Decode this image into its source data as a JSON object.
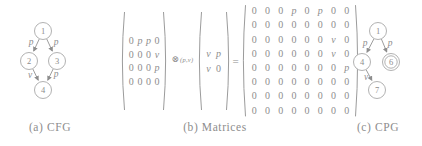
{
  "captions": {
    "a": "(a) CFG",
    "b": "(b) Matrices",
    "c": "(c) CPG"
  },
  "cfg": {
    "nodes": [
      {
        "id": "1"
      },
      {
        "id": "2"
      },
      {
        "id": "3"
      },
      {
        "id": "4"
      }
    ],
    "edges": [
      {
        "from": "1",
        "to": "2",
        "label": "p"
      },
      {
        "from": "1",
        "to": "3",
        "label": "p"
      },
      {
        "from": "2",
        "to": "4",
        "label": "v"
      },
      {
        "from": "3",
        "to": "4",
        "label": "p"
      }
    ]
  },
  "cpg": {
    "nodes": [
      {
        "id": "1"
      },
      {
        "id": "4"
      },
      {
        "id": "6",
        "double_circle": true
      },
      {
        "id": "7"
      }
    ],
    "edges": [
      {
        "from": "1",
        "to": "4",
        "label": "p"
      },
      {
        "from": "1",
        "to": "6",
        "label": "p"
      },
      {
        "from": "4",
        "to": "7",
        "label": "v"
      }
    ]
  },
  "matrices": {
    "a": {
      "rows": [
        [
          "0",
          "p",
          "p",
          "0"
        ],
        [
          "0",
          "0",
          "0",
          "v"
        ],
        [
          "0",
          "0",
          "0",
          "p"
        ],
        [
          "0",
          "0",
          "0",
          "0"
        ]
      ]
    },
    "operator": {
      "symbol": "⊗",
      "subscript": "(p,v)"
    },
    "b": {
      "rows": [
        [
          "v",
          "p"
        ],
        [
          "v",
          "0"
        ]
      ]
    },
    "equals": "=",
    "c": {
      "rows": [
        [
          "0",
          "0",
          "0",
          "p",
          "0",
          "p",
          "0",
          "0"
        ],
        [
          "0",
          "0",
          "0",
          "0",
          "0",
          "0",
          "0",
          "0"
        ],
        [
          "0",
          "0",
          "0",
          "0",
          "0",
          "0",
          "v",
          "0"
        ],
        [
          "0",
          "0",
          "0",
          "0",
          "0",
          "0",
          "v",
          "0"
        ],
        [
          "0",
          "0",
          "0",
          "0",
          "0",
          "0",
          "0",
          "p"
        ],
        [
          "0",
          "0",
          "0",
          "0",
          "0",
          "0",
          "0",
          "0"
        ],
        [
          "0",
          "0",
          "0",
          "0",
          "0",
          "0",
          "0",
          "0"
        ],
        [
          "0",
          "0",
          "0",
          "0",
          "0",
          "0",
          "0",
          "0"
        ]
      ]
    }
  }
}
